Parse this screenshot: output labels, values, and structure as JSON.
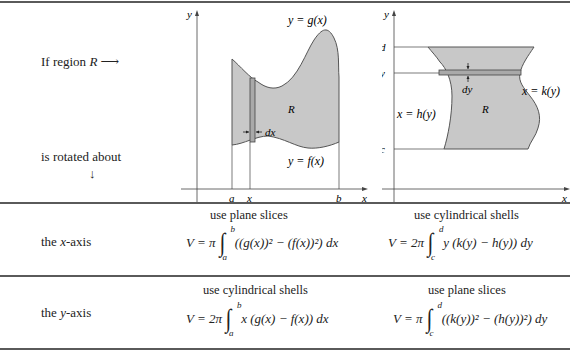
{
  "intro": {
    "if_region": "If region",
    "region_symbol": "R",
    "arrow_right": "⟶",
    "rotated_about": "is rotated about",
    "arrow_down": "↓"
  },
  "left_graph": {
    "y_axis_label": "y",
    "x_axis_label": "x",
    "upper_curve_label": "y = g(x)",
    "lower_curve_label": "y = f(x)",
    "region_label": "R",
    "slice_width_label": "dx",
    "tick_labels": [
      "a",
      "x",
      "b"
    ]
  },
  "right_graph": {
    "y_axis_label": "y",
    "x_axis_label": "x",
    "left_curve_label": "x = h(y)",
    "right_curve_label": "x = k(y)",
    "region_label": "R",
    "slice_width_label": "dy",
    "tick_labels": [
      "d",
      "y",
      "c"
    ]
  },
  "rows": [
    {
      "axis_label_pre": "the ",
      "axis_label_var": "x",
      "axis_label_post": "-axis",
      "left_method": "use plane slices",
      "left_formula": {
        "lhs": "V = π",
        "lower": "a",
        "upper": "b",
        "integrand": "((g(x))² − (f(x))²) dx"
      },
      "right_method": "use cylindrical shells",
      "right_formula": {
        "lhs": "V = 2π",
        "lower": "c",
        "upper": "d",
        "integrand": "y (k(y) − h(y)) dy"
      }
    },
    {
      "axis_label_pre": "the ",
      "axis_label_var": "y",
      "axis_label_post": "-axis",
      "left_method": "use cylindrical shells",
      "left_formula": {
        "lhs": "V = 2π",
        "lower": "a",
        "upper": "b",
        "integrand": "x (g(x) − f(x)) dx"
      },
      "right_method": "use plane slices",
      "right_formula": {
        "lhs": "V = π",
        "lower": "c",
        "upper": "d",
        "integrand": "((k(y))² − (h(y))²) dy"
      }
    }
  ],
  "colors": {
    "region_fill": "#c8c8c8",
    "slice_fill": "#a9a9a9",
    "rule": "#5a5a5a",
    "curve": "#555555"
  }
}
